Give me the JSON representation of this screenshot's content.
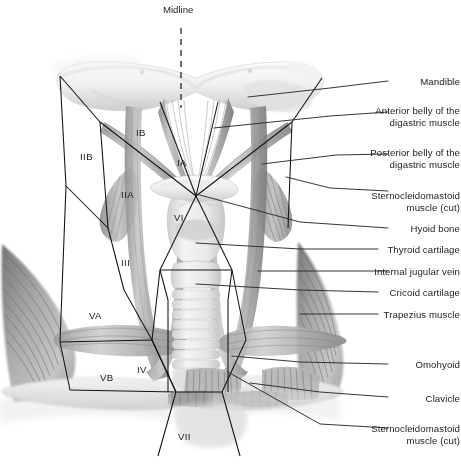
{
  "figure": {
    "kind": "anatomical-illustration",
    "midline_label": "Midline",
    "colors": {
      "ink": "#1d1d1d",
      "leader": "#2b2b2b",
      "boundary": "#111111",
      "bone_light": "#ededed",
      "bone_mid": "#d8d8d8",
      "muscle_light": "#c9c9c9",
      "muscle_mid": "#a0a0a0",
      "muscle_dark": "#6f6f6f",
      "cartilage": "#e6e6e6",
      "background": "#ffffff"
    }
  },
  "midline": {
    "label": "Midline",
    "x": 181,
    "text_x": 163,
    "text_y": 4,
    "line_top": 28,
    "line_bottom": 108
  },
  "callouts": [
    {
      "id": "mandible",
      "label": "Mandible",
      "lines": [
        "Mandible"
      ],
      "text_x": 410,
      "text_y": 76,
      "leader": [
        [
          388,
          81
        ],
        [
          330,
          88
        ],
        [
          248,
          97
        ]
      ]
    },
    {
      "id": "anterior-digastric",
      "label": "Anterior belly of the digastric muscle",
      "lines": [
        "Anterior belly of the",
        "digastric muscle"
      ],
      "text_x": 360,
      "text_y": 105,
      "leader": [
        [
          388,
          112
        ],
        [
          330,
          116
        ],
        [
          214,
          128
        ]
      ]
    },
    {
      "id": "posterior-digastric",
      "label": "Posterior belly of the digastric muscle",
      "lines": [
        "Posterior belly of the",
        "digastric muscle"
      ],
      "text_x": 360,
      "text_y": 147,
      "leader": [
        [
          388,
          154
        ],
        [
          336,
          155
        ],
        [
          262,
          164
        ]
      ]
    },
    {
      "id": "scm-cut-upper",
      "label": "Sternocleidomastoid muscle (cut)",
      "lines": [
        "Sternocleidomastoid",
        "muscle (cut)"
      ],
      "text_x": 355,
      "text_y": 190,
      "leader": [
        [
          388,
          191
        ],
        [
          330,
          188
        ],
        [
          286,
          177
        ]
      ]
    },
    {
      "id": "hyoid-bone",
      "label": "Hyoid bone",
      "lines": [
        "Hyoid bone"
      ],
      "text_x": 400,
      "text_y": 223,
      "leader": [
        [
          388,
          228
        ],
        [
          300,
          222
        ],
        [
          196,
          194
        ]
      ]
    },
    {
      "id": "thyroid-cartilage",
      "label": "Thyroid cartilage",
      "lines": [
        "Thyroid cartilage"
      ],
      "text_x": 380,
      "text_y": 244,
      "leader": [
        [
          378,
          249
        ],
        [
          300,
          249
        ],
        [
          196,
          243
        ]
      ]
    },
    {
      "id": "internal-jugular",
      "label": "Internal jugular vein",
      "lines": [
        "Internal jugular vein"
      ],
      "text_x": 368,
      "text_y": 266,
      "leader": [
        [
          388,
          271
        ],
        [
          330,
          271
        ],
        [
          258,
          271
        ]
      ]
    },
    {
      "id": "cricoid-cartilage",
      "label": "Cricoid cartilage",
      "lines": [
        "Cricoid cartilage"
      ],
      "text_x": 382,
      "text_y": 287,
      "leader": [
        [
          378,
          292
        ],
        [
          300,
          290
        ],
        [
          196,
          284
        ]
      ]
    },
    {
      "id": "trapezius",
      "label": "Trapezius muscle",
      "lines": [
        "Trapezius muscle"
      ],
      "text_x": 376,
      "text_y": 309,
      "leader": [
        [
          378,
          314
        ],
        [
          330,
          314
        ],
        [
          300,
          314
        ]
      ]
    },
    {
      "id": "omohyoid",
      "label": "Omohyoid",
      "lines": [
        "Omohyoid"
      ],
      "text_x": 402,
      "text_y": 359,
      "leader": [
        [
          388,
          364
        ],
        [
          300,
          362
        ],
        [
          232,
          356
        ]
      ]
    },
    {
      "id": "clavicle",
      "label": "Clavicle",
      "lines": [
        "Clavicle"
      ],
      "text_x": 410,
      "text_y": 393,
      "leader": [
        [
          388,
          397
        ],
        [
          320,
          392
        ],
        [
          250,
          383
        ]
      ]
    },
    {
      "id": "scm-cut-lower",
      "label": "Sternocleidomastoid muscle (cut)",
      "lines": [
        "Sternocleidomastoid",
        "muscle (cut)"
      ],
      "text_x": 355,
      "text_y": 423,
      "leader": [
        [
          388,
          428
        ],
        [
          320,
          424
        ],
        [
          228,
          372
        ]
      ]
    }
  ],
  "levels": [
    {
      "id": "IB",
      "label": "IB",
      "x": 136,
      "y": 127
    },
    {
      "id": "IIB",
      "label": "IIB",
      "x": 80,
      "y": 151
    },
    {
      "id": "IA",
      "label": "IA",
      "x": 177,
      "y": 157
    },
    {
      "id": "IIA",
      "label": "IIA",
      "x": 121,
      "y": 189
    },
    {
      "id": "VI",
      "label": "VI",
      "x": 174,
      "y": 212
    },
    {
      "id": "III",
      "label": "III",
      "x": 121,
      "y": 257
    },
    {
      "id": "VA",
      "label": "VA",
      "x": 89,
      "y": 310
    },
    {
      "id": "IV",
      "label": "IV",
      "x": 137,
      "y": 364
    },
    {
      "id": "VB",
      "label": "VB",
      "x": 100,
      "y": 372
    },
    {
      "id": "VII",
      "label": "VII",
      "x": 178,
      "y": 431
    }
  ]
}
